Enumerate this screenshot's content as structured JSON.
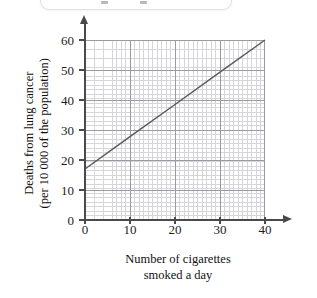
{
  "top_card": {
    "present": true,
    "marks": [
      "mark-left",
      "mark-right"
    ]
  },
  "chart_data": {
    "type": "line",
    "title": "",
    "subtitle": "",
    "xlabel": "Number of cigarettes smoked a day",
    "xlabel_line1": "Number of cigarettes",
    "xlabel_line2": "smoked a day",
    "ylabel": "Deaths from lung cancer (per 10 000 of the population)",
    "ylabel_line1": "Deaths from lung cancer",
    "ylabel_line2": "(per 10 000 of the population)",
    "xlim": [
      0,
      40
    ],
    "ylim": [
      0,
      60
    ],
    "xticks": [
      0,
      10,
      20,
      30,
      40
    ],
    "yticks": [
      0,
      10,
      20,
      30,
      40,
      50,
      60
    ],
    "xtick_labels": [
      "0",
      "10",
      "20",
      "30",
      "40"
    ],
    "ytick_labels": [
      "0",
      "10",
      "20",
      "30",
      "40",
      "50",
      "60"
    ],
    "x_minor_step": 2,
    "y_minor_step": 2,
    "grid": true,
    "grid_minor": true,
    "legend": "none",
    "series": [
      {
        "name": "line-of-best-fit",
        "color": "#5a5a5a",
        "x": [
          0,
          40
        ],
        "values": [
          17,
          60
        ],
        "points": [
          [
            0,
            17
          ],
          [
            10,
            27.8
          ],
          [
            20,
            38.5
          ],
          [
            30,
            49.3
          ],
          [
            40,
            60
          ]
        ],
        "slope": 1.075,
        "intercept": 17
      }
    ]
  },
  "axes": {
    "y_axis_arrow": "up-arrow-icon",
    "x_axis_arrow": "right-arrow-icon",
    "axis_color": "#4a4a4a",
    "grid_major_color": "#9a9aa0",
    "grid_minor_color": "#d6d6da"
  }
}
